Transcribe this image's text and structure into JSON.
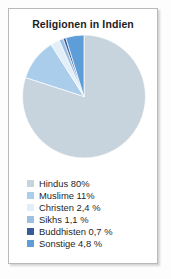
{
  "figure": {
    "title": "Religionen in Indien",
    "frame_border_color": "#b9b9b9",
    "background_color": "#ffffff"
  },
  "chart_data": {
    "type": "pie",
    "title": "Religionen in Indien",
    "xlabel": "",
    "ylabel": "",
    "legend_position": "bottom-left",
    "grid": false,
    "start_angle_deg": 90,
    "direction": "clockwise",
    "unit": "%",
    "categories": [
      "Hindus",
      "Muslime",
      "Christen",
      "Sikhs",
      "Buddhisten",
      "Sonstige"
    ],
    "values": [
      80,
      11,
      2.4,
      1.1,
      0.7,
      4.8
    ],
    "value_labels": [
      "80%",
      "11%",
      "2,4 %",
      "1,1 %",
      "0,7 %",
      "4,8 %"
    ],
    "colors": [
      "#c8d4dd",
      "#a9cdea",
      "#e2eef8",
      "#9dc0e2",
      "#3a5b9a",
      "#5d9dd8"
    ],
    "slices": [
      {
        "label": "Hindus",
        "value": 80,
        "value_label": "80%",
        "color": "#c8d4dd"
      },
      {
        "label": "Muslime",
        "value": 11,
        "value_label": "11%",
        "color": "#a9cdea"
      },
      {
        "label": "Christen",
        "value": 2.4,
        "value_label": "2,4 %",
        "color": "#e2eef8"
      },
      {
        "label": "Sikhs",
        "value": 1.1,
        "value_label": "1,1 %",
        "color": "#9dc0e2"
      },
      {
        "label": "Buddhisten",
        "value": 0.7,
        "value_label": "0,7 %",
        "color": "#3a5b9a"
      },
      {
        "label": "Sonstige",
        "value": 4.8,
        "value_label": "4,8 %",
        "color": "#5d9dd8"
      }
    ]
  },
  "legend": {
    "items": [
      {
        "label": "Hindus 80%",
        "color": "#c8d4dd"
      },
      {
        "label": "Muslime 11%",
        "color": "#a9cdea"
      },
      {
        "label": "Christen 2,4 %",
        "color": "#e2eef8"
      },
      {
        "label": "Sikhs 1,1 %",
        "color": "#9dc0e2"
      },
      {
        "label": "Buddhisten 0,7 %",
        "color": "#3a5b9a"
      },
      {
        "label": "Sonstige 4,8 %",
        "color": "#5d9dd8"
      }
    ]
  }
}
